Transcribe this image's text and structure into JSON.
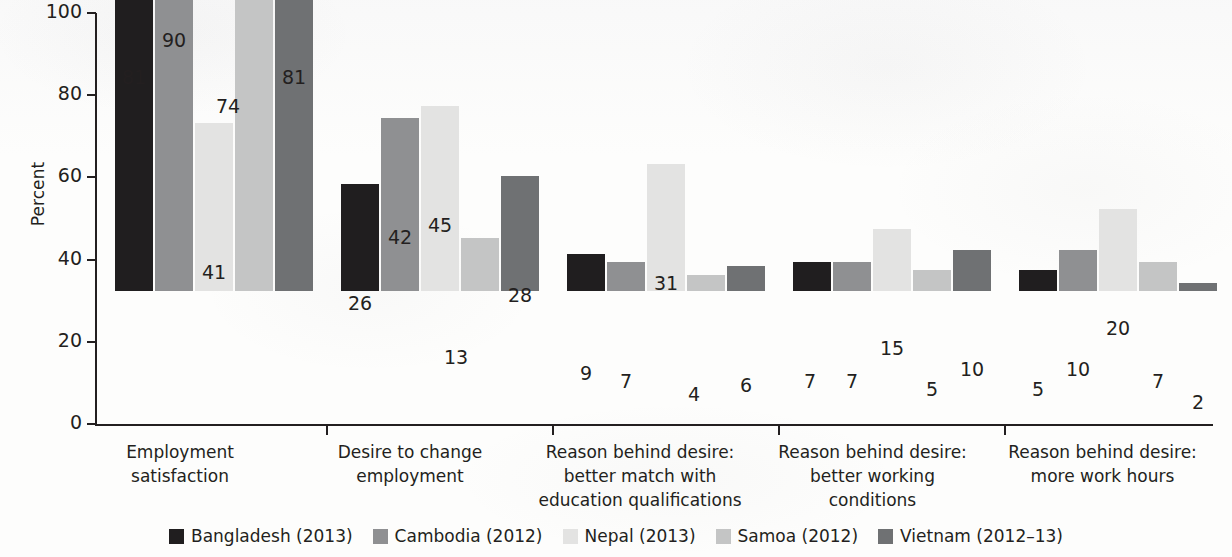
{
  "chart_data": {
    "type": "bar",
    "title": "",
    "subtitle": "",
    "xlabel": "",
    "ylabel": "Percent",
    "ylim": [
      0,
      100
    ],
    "yticks": [
      0,
      20,
      40,
      60,
      80,
      100
    ],
    "ytick_labels": [
      "0",
      "20",
      "40",
      "60",
      "80",
      "100"
    ],
    "grid": false,
    "legend_position": "bottom",
    "categories": [
      "Employment satisfaction",
      "Desire to change employment",
      "Reason behind desire: better match with education qualifications",
      "Reason behind desire: better working conditions",
      "Reason behind desire: more work hours"
    ],
    "category_lines": [
      [
        "Employment",
        "satisfaction"
      ],
      [
        "Desire to change",
        "employment"
      ],
      [
        "Reason behind desire:",
        "better match with",
        "education qualifications"
      ],
      [
        "Reason behind desire:",
        "better working",
        "conditions"
      ],
      [
        "Reason behind desire:",
        "more work hours"
      ]
    ],
    "series": [
      {
        "name": "Bangladesh (2013)",
        "color": "#201e1f",
        "values": [
          81,
          26,
          9,
          7,
          5
        ]
      },
      {
        "name": "Cambodia (2012)",
        "color": "#8f9092",
        "values": [
          90,
          42,
          7,
          7,
          10
        ]
      },
      {
        "name": "Nepal (2013)",
        "color": "#e3e3e2",
        "values": [
          41,
          45,
          31,
          15,
          20
        ]
      },
      {
        "name": "Samoa (2012)",
        "color": "#c4c5c5",
        "values": [
          74,
          13,
          4,
          5,
          7
        ]
      },
      {
        "name": "Vietnam (2012-13)",
        "color": "#6f7173",
        "values": [
          81,
          28,
          6,
          10,
          2
        ]
      }
    ],
    "value_labels": {
      "Employment satisfaction": [
        "81",
        "90",
        "41",
        "74",
        "81"
      ],
      "Desire to change employment": [
        "26",
        "42",
        "45",
        "13",
        "28"
      ],
      "Reason behind desire: better match with education qualifications": [
        "9",
        "7",
        "31",
        "4",
        "6"
      ],
      "Reason behind desire: better working conditions": [
        "7",
        "7",
        "15",
        "5",
        "10"
      ],
      "Reason behind desire: more work hours": [
        "5",
        "10",
        "20",
        "7",
        "2"
      ]
    }
  },
  "axis": {
    "y_title": "Percent",
    "y_tick_0": "0",
    "y_tick_20": "20",
    "y_tick_40": "40",
    "y_tick_60": "60",
    "y_tick_80": "80",
    "y_tick_100": "100"
  },
  "categories_text": {
    "g1l1": "Employment",
    "g1l2": "satisfaction",
    "g2l1": "Desire to change",
    "g2l2": "employment",
    "g3l1": "Reason behind desire:",
    "g3l2": "better match with",
    "g3l3": "education qualifications",
    "g4l1": "Reason behind desire:",
    "g4l2": "better working",
    "g4l3": "conditions",
    "g5l1": "Reason behind desire:",
    "g5l2": "more work hours"
  },
  "legend": {
    "items": [
      {
        "label": "Bangladesh (2013)"
      },
      {
        "label": "Cambodia (2012)"
      },
      {
        "label": "Nepal (2013)"
      },
      {
        "label": "Samoa (2012)"
      },
      {
        "label": "Vietnam (2012–13)"
      }
    ]
  }
}
